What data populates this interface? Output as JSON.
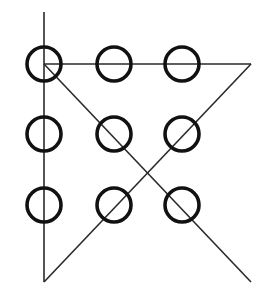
{
  "diagram": {
    "width": 269,
    "height": 299,
    "colors": {
      "background": "#ffffff",
      "circle_stroke": "#111111",
      "line_stroke": "#2a2a2a"
    },
    "circle_radius": 17,
    "circle_stroke_width": 3.6,
    "line_width": 1.6,
    "grid": {
      "columns_x": [
        44,
        114,
        182
      ],
      "rows_y": [
        64,
        134,
        205
      ]
    },
    "circles": [
      {
        "id": "r1c1",
        "cx": 44,
        "cy": 64
      },
      {
        "id": "r1c2",
        "cx": 114,
        "cy": 64
      },
      {
        "id": "r1c3",
        "cx": 182,
        "cy": 64
      },
      {
        "id": "r2c1",
        "cx": 44,
        "cy": 134
      },
      {
        "id": "r2c2",
        "cx": 114,
        "cy": 134
      },
      {
        "id": "r2c3",
        "cx": 182,
        "cy": 134
      },
      {
        "id": "r3c1",
        "cx": 44,
        "cy": 205
      },
      {
        "id": "r3c2",
        "cx": 114,
        "cy": 205
      },
      {
        "id": "r3c3",
        "cx": 182,
        "cy": 205
      }
    ],
    "path": {
      "description": "Four connected straight line segments",
      "points": [
        {
          "x": 44,
          "y": 12
        },
        {
          "x": 44,
          "y": 282
        },
        {
          "x": 251,
          "y": 64
        },
        {
          "x": 44,
          "y": 64
        },
        {
          "x": 251,
          "y": 282
        }
      ]
    }
  }
}
